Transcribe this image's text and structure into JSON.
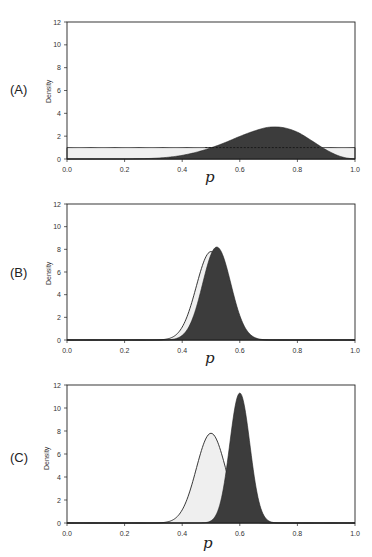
{
  "figure": {
    "panels": [
      {
        "label": "(A)",
        "ylabel": "Density",
        "xlabel": "p"
      },
      {
        "label": "(B)",
        "ylabel": "Density",
        "xlabel": "p"
      },
      {
        "label": "(C)",
        "ylabel": "Density",
        "xlabel": "p"
      }
    ],
    "colors": {
      "prior_fill": "#efefef",
      "posterior_fill": "#3c3c3c",
      "line": "#222222"
    }
  },
  "chart_data": [
    {
      "type": "area",
      "title": "(A)",
      "xlabel": "p",
      "ylabel": "Density",
      "xlim": [
        0.0,
        1.0
      ],
      "ylim": [
        0,
        12
      ],
      "x_ticks": [
        "0.0",
        "0.2",
        "0.4",
        "0.6",
        "0.8",
        "1.0"
      ],
      "y_ticks": [
        "0",
        "2",
        "4",
        "6",
        "8",
        "10",
        "12"
      ],
      "grid": false,
      "series": [
        {
          "name": "prior (light)",
          "style": "light",
          "shape": "uniform",
          "height": 1.0,
          "x": [
            0.0,
            1.0
          ],
          "values": [
            1.0,
            1.0
          ]
        },
        {
          "name": "posterior (dark)",
          "style": "dark",
          "shape": "skewed",
          "mode": 0.7,
          "peak": 2.8,
          "x": [
            0.2,
            0.25,
            0.3,
            0.35,
            0.4,
            0.45,
            0.5,
            0.55,
            0.6,
            0.65,
            0.7,
            0.75,
            0.8,
            0.85,
            0.9,
            0.95,
            1.0
          ],
          "values": [
            0.0,
            0.02,
            0.06,
            0.15,
            0.32,
            0.6,
            0.98,
            1.45,
            1.98,
            2.45,
            2.78,
            2.75,
            2.35,
            1.6,
            0.8,
            0.22,
            0.0
          ]
        }
      ],
      "annotations": [
        "dashed line at density 1 across dark region"
      ]
    },
    {
      "type": "area",
      "title": "(B)",
      "xlabel": "p",
      "ylabel": "Density",
      "xlim": [
        0.0,
        1.0
      ],
      "ylim": [
        0,
        12
      ],
      "x_ticks": [
        "0.0",
        "0.2",
        "0.4",
        "0.6",
        "0.8",
        "1.0"
      ],
      "y_ticks": [
        "0",
        "2",
        "4",
        "6",
        "8",
        "10",
        "12"
      ],
      "grid": false,
      "series": [
        {
          "name": "prior (light)",
          "style": "light",
          "mode": 0.5,
          "peak": 7.8,
          "sd": 0.051,
          "x": [
            0.35,
            0.4,
            0.45,
            0.5,
            0.55,
            0.6,
            0.65
          ],
          "values": [
            0.1,
            1.1,
            4.7,
            7.8,
            4.7,
            1.1,
            0.1
          ]
        },
        {
          "name": "posterior (dark)",
          "style": "dark",
          "mode": 0.52,
          "peak": 8.2,
          "sd": 0.049,
          "x": [
            0.35,
            0.4,
            0.45,
            0.5,
            0.52,
            0.55,
            0.6,
            0.65,
            0.7
          ],
          "values": [
            0.02,
            0.45,
            2.9,
            7.6,
            8.2,
            7.0,
            2.2,
            0.25,
            0.01
          ]
        }
      ]
    },
    {
      "type": "area",
      "title": "(C)",
      "xlabel": "p",
      "ylabel": "Density",
      "xlim": [
        0.0,
        1.0
      ],
      "ylim": [
        0,
        12
      ],
      "x_ticks": [
        "0.0",
        "0.2",
        "0.4",
        "0.6",
        "0.8",
        "1.0"
      ],
      "y_ticks": [
        "0",
        "2",
        "4",
        "6",
        "8",
        "10",
        "12"
      ],
      "grid": false,
      "series": [
        {
          "name": "prior (light)",
          "style": "light",
          "mode": 0.5,
          "peak": 7.8,
          "sd": 0.051,
          "x": [
            0.35,
            0.4,
            0.45,
            0.5,
            0.55,
            0.6,
            0.65
          ],
          "values": [
            0.1,
            1.1,
            4.7,
            7.8,
            4.7,
            1.1,
            0.1
          ]
        },
        {
          "name": "posterior (dark)",
          "style": "dark",
          "mode": 0.6,
          "peak": 11.3,
          "sd": 0.035,
          "x": [
            0.5,
            0.55,
            0.6,
            0.65,
            0.7
          ],
          "values": [
            0.19,
            4.1,
            11.3,
            4.1,
            0.19
          ]
        }
      ]
    }
  ]
}
